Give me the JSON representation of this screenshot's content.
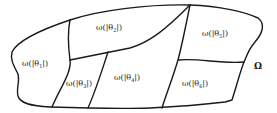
{
  "diagram": {
    "domain_label": "Ω",
    "regions": [
      {
        "id": "1",
        "prefix": "ω(|θ",
        "sub": "1",
        "suffix": "|)"
      },
      {
        "id": "2",
        "prefix": "ω(|θ",
        "sub": "2",
        "suffix": "|)"
      },
      {
        "id": "3",
        "prefix": "ω(|θ",
        "sub": "3",
        "suffix": "|)"
      },
      {
        "id": "4",
        "prefix": "ω(|θ",
        "sub": "4",
        "suffix": "|)"
      },
      {
        "id": "5",
        "prefix": "ω(|θ",
        "sub": "5",
        "suffix": "|)"
      },
      {
        "id": "6",
        "prefix": "ω(|θ",
        "sub": "6",
        "suffix": "|)"
      }
    ],
    "colors": {
      "stroke": "#1a1a1a",
      "background": "#ffffff"
    }
  }
}
